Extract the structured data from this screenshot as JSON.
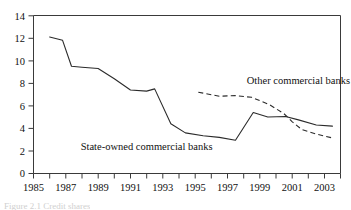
{
  "chart_data": {
    "type": "line",
    "title": "",
    "xlabel": "",
    "ylabel": "",
    "xlim": [
      1985,
      2004
    ],
    "ylim": [
      0,
      14
    ],
    "yticks": [
      0,
      2,
      4,
      6,
      8,
      10,
      12,
      14
    ],
    "ytick_labels": [
      "0",
      "2",
      "4",
      "6",
      "8",
      "10",
      "12",
      "14"
    ],
    "xticks": [
      1985,
      1987,
      1989,
      1991,
      1993,
      1995,
      1997,
      1999,
      2001,
      2003
    ],
    "xtick_labels": [
      "1985",
      "1987",
      "1989",
      "1991",
      "1993",
      "1995",
      "1997",
      "1999",
      "2001",
      "2003"
    ],
    "xminor_ticks": [
      1986,
      1988,
      1990,
      1992,
      1994,
      1996,
      1998,
      2000,
      2002,
      2004
    ],
    "grid": false,
    "legend_position": "inline-annotation",
    "series": [
      {
        "name": "State-owned commercial banks",
        "style": "solid",
        "color": "#2b2b2b",
        "annotation": "State-owned commercial banks",
        "x": [
          1986.0,
          1986.8,
          1987.35,
          1988.0,
          1989.0,
          1990.0,
          1991.0,
          1992.0,
          1992.5,
          1993.5,
          1994.4,
          1995.5,
          1996.5,
          1997.5,
          1998.6,
          1999.5,
          2000.6,
          2001.4,
          2002.5,
          2003.5
        ],
        "y": [
          12.1,
          11.8,
          9.5,
          9.42,
          9.3,
          8.4,
          7.4,
          7.3,
          7.5,
          4.4,
          3.6,
          3.35,
          3.2,
          2.95,
          5.4,
          5.0,
          5.05,
          4.75,
          4.3,
          4.2
        ]
      },
      {
        "name": "Other commercial banks",
        "style": "dashed",
        "color": "#2b2b2b",
        "annotation": "Other commercial banks",
        "x": [
          1995.2,
          1996.5,
          1997.5,
          1998.5,
          1999.6,
          2000.5,
          2001.0,
          2001.6,
          2002.5,
          2003.5
        ],
        "y": [
          7.2,
          6.85,
          6.9,
          6.75,
          6.1,
          5.3,
          4.6,
          3.9,
          3.5,
          3.15
        ]
      }
    ],
    "annotations": [
      {
        "text": "Other commercial banks",
        "x": 1998.2,
        "y": 7.9
      },
      {
        "text": "State-owned commercial banks",
        "x": 1992.0,
        "y": 2.1
      }
    ]
  },
  "figure": {
    "caption": "Figure 2.1  Credit shares"
  }
}
